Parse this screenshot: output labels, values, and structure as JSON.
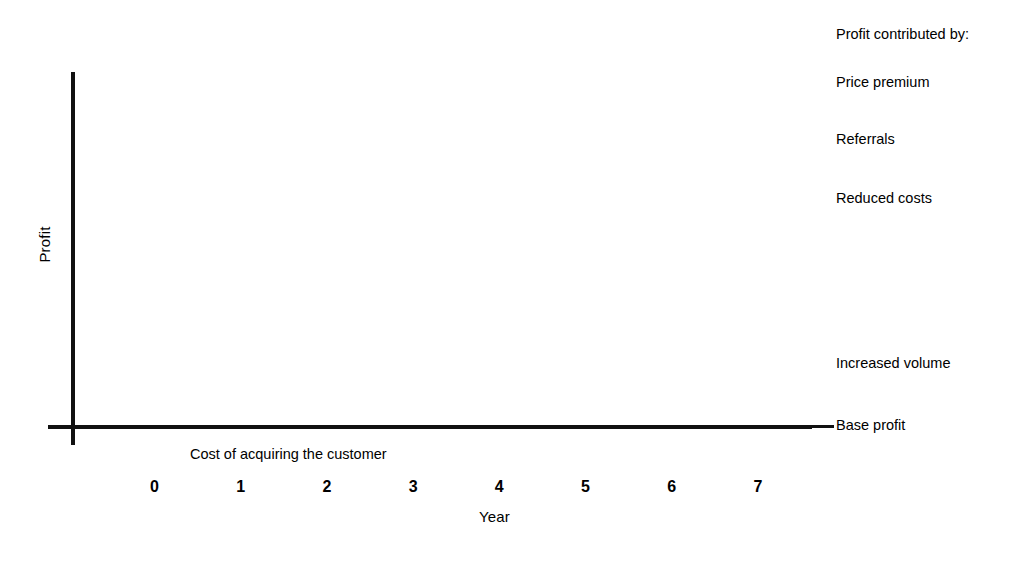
{
  "chart_data": {
    "type": "bar",
    "title": "",
    "subtitle": "",
    "xlabel": "Year",
    "ylabel": "Profit",
    "categories": [
      "0",
      "1",
      "2",
      "3",
      "4",
      "5",
      "6",
      "7"
    ],
    "stacked": true,
    "grid": false,
    "legend_position": "right",
    "legend_title": "Profit contributed by:",
    "annotations": [
      {
        "text": "Cost of acquiring the customer",
        "attached_to": "0"
      }
    ],
    "axis_note": "Profit axis is unlabeled (no numeric ticks); values below are relative plot units read off the bar pixel heights.",
    "ylim": [
      -50,
      330
    ],
    "series": [
      {
        "name": "Base profit",
        "color": "#bdbdbd",
        "values": [
          -50,
          55,
          55,
          55,
          55,
          55,
          55,
          55
        ]
      },
      {
        "name": "Increased volume",
        "color": "#7a7a7a",
        "values": [
          0,
          0,
          42,
          70,
          93,
          113,
          133,
          158
        ]
      },
      {
        "name": "Reduced costs",
        "color": "#ffffff",
        "values": [
          0,
          0,
          30,
          40,
          52,
          60,
          70,
          62
        ]
      },
      {
        "name": "Price premium",
        "color": "#262626",
        "values": [
          0,
          0,
          43,
          55,
          64,
          67,
          65,
          80
        ]
      }
    ],
    "bars": [
      {
        "category": "0",
        "direction": "down",
        "segments": [
          {
            "name": "Base profit",
            "label": "Cost of acquiring the customer",
            "top": 429,
            "bottom": 480
          }
        ]
      },
      {
        "category": "1",
        "direction": "up",
        "segments": [
          {
            "name": "Base profit",
            "top": 369,
            "bottom": 425
          }
        ]
      },
      {
        "category": "2",
        "direction": "up",
        "segments": [
          {
            "name": "Base profit",
            "top": 369,
            "bottom": 425
          },
          {
            "name": "Increased volume",
            "top": 327,
            "bottom": 369
          },
          {
            "name": "Reduced costs",
            "top": 297,
            "bottom": 327
          },
          {
            "name": "Price premium",
            "top": 245,
            "bottom": 297
          }
        ]
      },
      {
        "category": "3",
        "direction": "up",
        "segments": [
          {
            "name": "Base profit",
            "top": 369,
            "bottom": 425
          },
          {
            "name": "Increased volume",
            "top": 299,
            "bottom": 369
          },
          {
            "name": "Reduced costs",
            "top": 259,
            "bottom": 299
          },
          {
            "name": "Price premium",
            "top": 203,
            "bottom": 259
          }
        ]
      },
      {
        "category": "4",
        "direction": "up",
        "segments": [
          {
            "name": "Base profit",
            "top": 369,
            "bottom": 425
          },
          {
            "name": "Increased volume",
            "top": 276,
            "bottom": 369
          },
          {
            "name": "Reduced costs",
            "top": 223,
            "bottom": 276
          },
          {
            "name": "Price premium",
            "top": 158,
            "bottom": 223
          }
        ]
      },
      {
        "category": "5",
        "direction": "up",
        "segments": [
          {
            "name": "Base profit",
            "top": 369,
            "bottom": 425
          },
          {
            "name": "Increased volume",
            "top": 256,
            "bottom": 369
          },
          {
            "name": "Reduced costs",
            "top": 196,
            "bottom": 256
          },
          {
            "name": "Price premium",
            "top": 128,
            "bottom": 196
          }
        ]
      },
      {
        "category": "6",
        "direction": "up",
        "segments": [
          {
            "name": "Base profit",
            "top": 369,
            "bottom": 425
          },
          {
            "name": "Increased volume",
            "top": 236,
            "bottom": 369
          },
          {
            "name": "Reduced costs",
            "top": 165,
            "bottom": 236
          },
          {
            "name": "Price premium",
            "top": 100,
            "bottom": 165
          }
        ]
      },
      {
        "category": "7",
        "direction": "up",
        "segments": [
          {
            "name": "Base profit",
            "top": 369,
            "bottom": 425
          },
          {
            "name": "Increased volume",
            "top": 211,
            "bottom": 369
          },
          {
            "name": "Reduced costs",
            "top": 149,
            "bottom": 211
          },
          {
            "name": "Price premium",
            "top": 69,
            "bottom": 149
          }
        ]
      }
    ]
  },
  "axes": {
    "y_label": "Profit",
    "x_label": "Year"
  },
  "legend": {
    "title": "Profit contributed by:",
    "items": [
      {
        "label": "Price premium",
        "y": 74
      },
      {
        "label": "Referrals",
        "y": 131
      },
      {
        "label": "Reduced costs",
        "y": 190
      },
      {
        "label": "Increased volume",
        "y": 355
      },
      {
        "label": "Base profit",
        "y": 417
      }
    ]
  },
  "annotations": {
    "cost_note": "Cost of acquiring the customer"
  },
  "colors": {
    "base_profit": "#bdbdbd",
    "increased_volume": "#7a7a7a",
    "reduced_costs": "#ffffff",
    "price_premium": "#262626",
    "ink": "#111111",
    "background": "#ffffff"
  }
}
